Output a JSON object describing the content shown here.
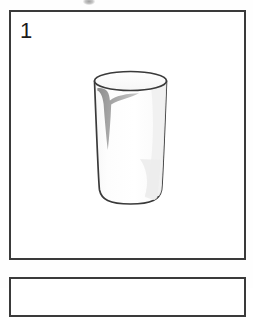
{
  "document": {
    "type": "picture-panel-sequence",
    "background_color": "#ffffff",
    "ink_color": "#3a3a3a"
  },
  "panels": [
    {
      "number": "1",
      "illustration": {
        "name": "drinking-glass",
        "description": "empty tall drinking glass, line drawing with grey highlight",
        "outline_color": "#3a3a3a",
        "fill_color": "#fdfdfd",
        "highlight_color": "#9b9b9b",
        "shadow_color": "#efefef"
      }
    },
    {
      "number": "",
      "illustration": null
    }
  ],
  "artifacts": {
    "top_smudge": "scan-smudge"
  }
}
